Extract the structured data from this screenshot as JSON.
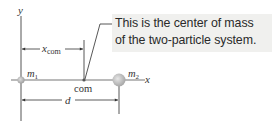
{
  "callout": {
    "line1": "This is the center of mass",
    "line2": "of the two-particle system."
  },
  "labels": {
    "y_axis": "y",
    "x_axis": "x",
    "m1": "m",
    "m1_sub": "1",
    "m2": "m",
    "m2_sub": "2",
    "xcom": "x",
    "xcom_sub": "com",
    "com": "com",
    "d": "d"
  },
  "colors": {
    "axis": "#555555",
    "particle": "#bbbbbb",
    "callout_bg": "#f0f0ee"
  }
}
